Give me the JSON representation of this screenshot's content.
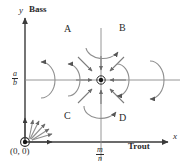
{
  "figure": {
    "type": "phase-plane-diagram",
    "background": "#ffffff",
    "line_color": "#555555",
    "text_color": "#2b2b2b"
  },
  "axes": {
    "x": {
      "variable": "x",
      "name": "Trout",
      "tick_label_numerator": "m",
      "tick_label_denominator": "n"
    },
    "y": {
      "variable": "y",
      "name": "Bass",
      "tick_label_numerator": "a",
      "tick_label_denominator": "b"
    }
  },
  "origin": {
    "label": "(0, 0)",
    "marker": "circled-dot",
    "behavior": "unstable-node-outward-arrows"
  },
  "equilibrium": {
    "marker": "circled-dot",
    "behavior": "stable-node-inward-arrows"
  },
  "regions": [
    {
      "id": "A",
      "label": "A"
    },
    {
      "id": "B",
      "label": "B"
    },
    {
      "id": "C",
      "label": "C"
    },
    {
      "id": "D",
      "label": "D"
    }
  ]
}
